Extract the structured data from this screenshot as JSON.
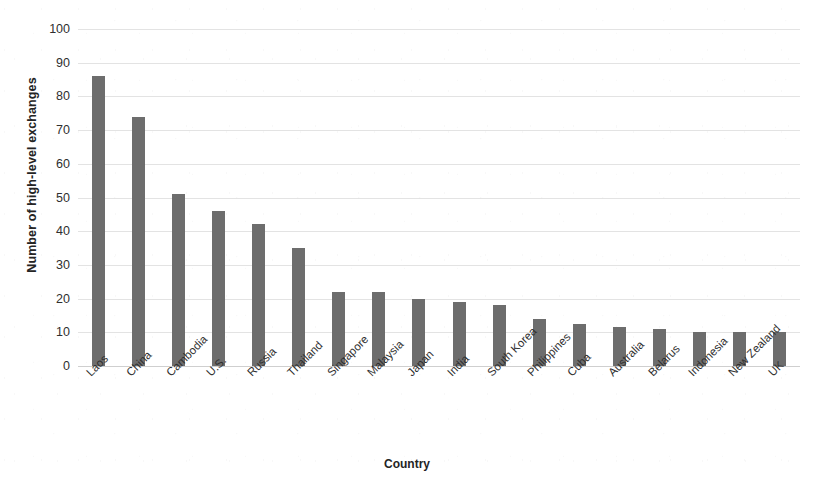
{
  "chart_data": {
    "type": "bar",
    "title": "",
    "xlabel": "Country",
    "ylabel": "Number of high-level exchanges",
    "categories": [
      "Laos",
      "China",
      "Cambodia",
      "U.S.",
      "Russia",
      "Thailand",
      "Singapore",
      "Malaysia",
      "Japan",
      "India",
      "South Korea",
      "Philippines",
      "Cuba",
      "Australia",
      "Belarus",
      "Indonesia",
      "New Zealand",
      "UK"
    ],
    "values": [
      86,
      74,
      51,
      46,
      42,
      35,
      22,
      22,
      20,
      19,
      18,
      14,
      12.5,
      11.5,
      11,
      10,
      10,
      10
    ],
    "ylim": [
      0,
      100
    ],
    "y_ticks": [
      0,
      10,
      20,
      30,
      40,
      50,
      60,
      70,
      80,
      90,
      100
    ],
    "y_tick_labels": [
      "0",
      "10",
      "20",
      "30",
      "40",
      "50",
      "60",
      "70",
      "80",
      "90",
      "100"
    ],
    "grid": true,
    "legend": false,
    "bar_color": "#6d6d6d",
    "gridline_color": "#e3e3e3",
    "x_tick_rotation": 45
  }
}
